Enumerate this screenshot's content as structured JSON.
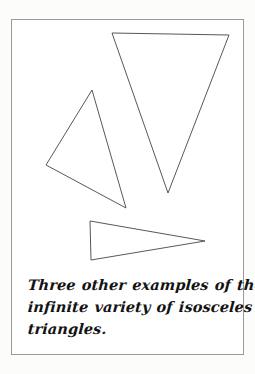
{
  "page": {
    "type": "scanned-textbook-figure-card",
    "background_color": "#fcfcfb",
    "frame_color": "#9a9a9a",
    "ink_color": "#4a4a4a",
    "text_color": "#131313"
  },
  "caption": {
    "full_text": "Three other examples of the infinite variety of isosceles triangles.",
    "lines": [
      "Three other examples of the",
      "infinite variety of isosceles",
      "triangles."
    ],
    "style": "handwritten-italic-script"
  },
  "figure": {
    "shape_count": 3,
    "stroke_color": "#585858",
    "stroke_width": 1,
    "fill": "none",
    "shapes": [
      {
        "name": "large-downward-triangle",
        "description": "Large inverted isosceles triangle pointing down, upper right of card",
        "points": "112,33 229,35 168,193",
        "vertices": [
          [
            112,
            33
          ],
          [
            229,
            35
          ],
          [
            168,
            193
          ]
        ]
      },
      {
        "name": "tilted-left-triangle",
        "description": "Tilted isosceles triangle, apex up-right, left of card",
        "points": "92,90 46,165 126,208",
        "vertices": [
          [
            92,
            90
          ],
          [
            46,
            165
          ],
          [
            126,
            208
          ]
        ]
      },
      {
        "name": "rightward-pointing-triangle",
        "description": "Narrow isosceles triangle pointing right, lower middle of card",
        "points": "90,221 205,241 91,260",
        "vertices": [
          [
            90,
            221
          ],
          [
            205,
            241
          ],
          [
            91,
            260
          ]
        ]
      }
    ]
  }
}
